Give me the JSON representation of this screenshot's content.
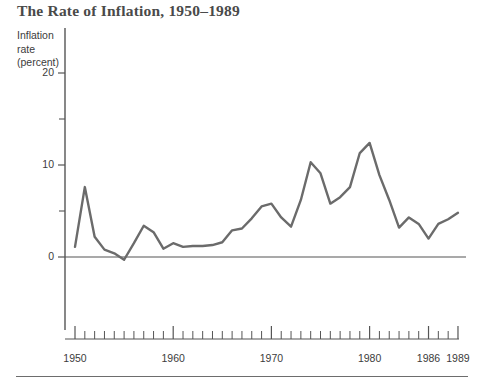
{
  "figure": {
    "title": "The Rate of Inflation, 1950–1989",
    "axis_title_lines": [
      "Inflation",
      "rate",
      "(percent)"
    ],
    "line_color": "#6b6b6b",
    "axis_color": "#555555",
    "text_color": "#3c3c3c"
  },
  "chart_data": {
    "type": "line",
    "title": "The Rate of Inflation, 1950–1989",
    "xlabel": "",
    "ylabel": "Inflation rate (percent)",
    "xlim": [
      1950,
      1989
    ],
    "ylim": [
      -8,
      23
    ],
    "grid": false,
    "legend": "none",
    "y_major_ticks": [
      0,
      10,
      20
    ],
    "y_minor_ticks": [
      5,
      15
    ],
    "y_tick_labels": [
      "0",
      "10",
      "20"
    ],
    "x_major_ticks": [
      1950,
      1960,
      1970,
      1980,
      1986,
      1989
    ],
    "x_tick_labels": [
      "1950",
      "1960",
      "1970",
      "1980",
      "1986",
      "1989"
    ],
    "x_minor_tick_step": 1,
    "series": [
      {
        "name": "Inflation rate (percent)",
        "x": [
          1950,
          1951,
          1952,
          1953,
          1954,
          1955,
          1956,
          1957,
          1958,
          1959,
          1960,
          1961,
          1962,
          1963,
          1964,
          1965,
          1966,
          1967,
          1968,
          1969,
          1970,
          1971,
          1972,
          1973,
          1974,
          1975,
          1976,
          1977,
          1978,
          1979,
          1980,
          1981,
          1982,
          1983,
          1984,
          1985,
          1986,
          1987,
          1988,
          1989
        ],
        "values": [
          1.1,
          7.6,
          2.2,
          0.8,
          0.4,
          -0.3,
          1.5,
          3.4,
          2.7,
          0.9,
          1.5,
          1.1,
          1.2,
          1.2,
          1.3,
          1.6,
          2.9,
          3.1,
          4.2,
          5.5,
          5.8,
          4.3,
          3.3,
          6.2,
          10.3,
          9.1,
          5.8,
          6.5,
          7.6,
          11.3,
          12.4,
          8.9,
          6.2,
          3.2,
          4.3,
          3.6,
          2.0,
          3.6,
          4.1,
          4.8
        ]
      }
    ]
  }
}
